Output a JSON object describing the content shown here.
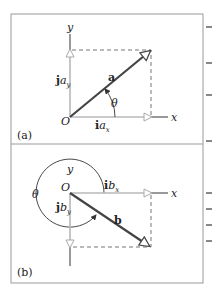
{
  "figure": {
    "panels": [
      {
        "id": "a",
        "label": "(a)",
        "origin_label": "O",
        "x_axis_label": "x",
        "y_axis_label": "y",
        "vector_label": "a",
        "angle_label": "θ",
        "x_component": {
          "unit": "i",
          "sym": "a",
          "sub": "x"
        },
        "y_component": {
          "unit": "j",
          "sym": "a",
          "sub": "y"
        }
      },
      {
        "id": "b",
        "label": "(b)",
        "origin_label": "O",
        "x_axis_label": "x",
        "y_axis_label": "y",
        "vector_label": "b",
        "angle_label": "θ",
        "x_component": {
          "unit": "i",
          "sym": "b",
          "sub": "x"
        },
        "y_component": {
          "unit": "j",
          "sym": "b",
          "sub": "y"
        }
      }
    ],
    "colors": {
      "frame": "#9a9a9a",
      "vector": "#444444",
      "component": "#b8b8b8",
      "axis": "#555555",
      "dashed": "#777777",
      "text": "#222222"
    }
  }
}
